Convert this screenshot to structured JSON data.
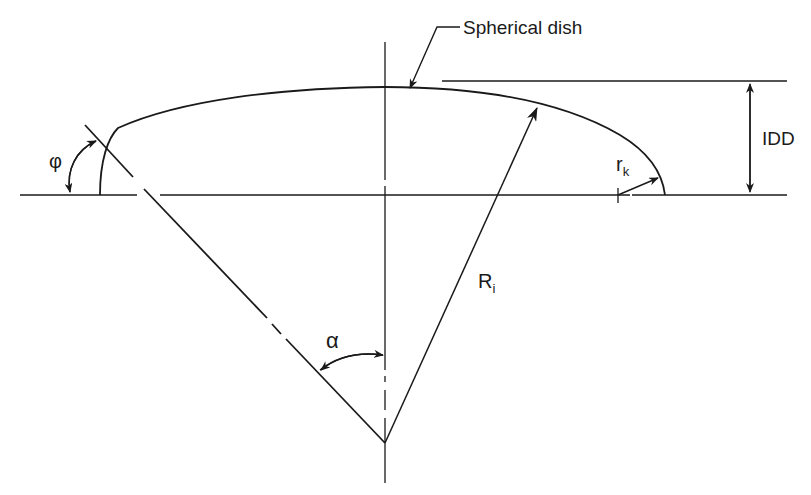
{
  "diagram": {
    "type": "engineering-drawing",
    "labels": {
      "spherical_dish": "Spherical dish",
      "idd": "IDD",
      "crown_radius": "R",
      "crown_radius_sub": "i",
      "knuckle_radius": "r",
      "knuckle_radius_sub": "k",
      "phi": "φ",
      "alpha": "α"
    },
    "colors": {
      "line": "#1a1a1a",
      "background": "#ffffff"
    }
  }
}
